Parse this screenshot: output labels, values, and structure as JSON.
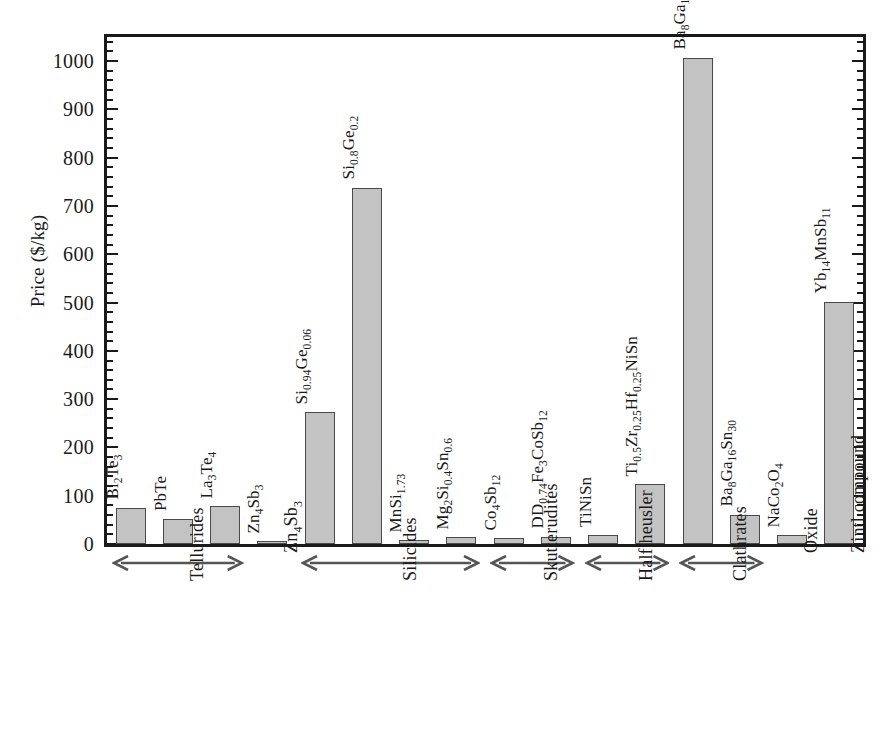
{
  "chart_data": {
    "type": "bar",
    "title": "",
    "xlabel": "",
    "ylabel": "Price ($/kg)",
    "ylim": [
      0,
      1050
    ],
    "grid": false,
    "legend": "none",
    "yticks": [
      0,
      100,
      200,
      300,
      400,
      500,
      600,
      700,
      800,
      900,
      1000
    ],
    "ytick_labels": [
      "0",
      "100",
      "200",
      "300",
      "400",
      "500",
      "600",
      "700",
      "800",
      "900",
      "1000"
    ],
    "minor_ticks_per_interval": 5,
    "categories": [
      "Bi2Te3",
      "PbTe",
      "La3Te4",
      "Zn4Sb3",
      "Si0.94Ge0.06",
      "Si0.8Ge0.2",
      "MnSi1.73",
      "Mg2Si0.4Sn0.6",
      "Co4Sb12",
      "DD0.74Fe3CoSb12",
      "TiNiSn",
      "Ti0.5Zr0.25Hf0.25NiSn",
      "Ba8Ga16Ge30",
      "Ba8Ga16Sn30",
      "NaCo2O4",
      "Yb14MnSb11"
    ],
    "values": [
      75,
      52,
      78,
      6,
      273,
      738,
      8,
      14,
      12,
      15,
      19,
      124,
      1007,
      61,
      18,
      502
    ],
    "bar_color": "#c3c3c3",
    "bar_edge_color": "#4a4a4a",
    "axis_color": "#1a1a1a"
  },
  "axis": {
    "y_title": "Price ($/kg)"
  },
  "bars": [
    {
      "label_html": "Bi<sub>2</sub>Te<sub>3</sub>",
      "value": 75
    },
    {
      "label_html": "PbTe",
      "value": 52
    },
    {
      "label_html": "La<sub>3</sub>Te<sub>4</sub>",
      "value": 78
    },
    {
      "label_html": "Zn<sub>4</sub>Sb<sub>3</sub>",
      "value": 6
    },
    {
      "label_html": "Si<sub>0.94</sub>Ge<sub>0.06</sub>",
      "value": 273
    },
    {
      "label_html": "Si<sub>0.8</sub>Ge<sub>0.2</sub>",
      "value": 738
    },
    {
      "label_html": "MnSi<sub>1.73</sub>",
      "value": 8
    },
    {
      "label_html": "Mg<sub>2</sub>Si<sub>0.4</sub>Sn<sub>0.6</sub>",
      "value": 14
    },
    {
      "label_html": "Co<sub>4</sub>Sb<sub>12</sub>",
      "value": 12
    },
    {
      "label_html": "DD<sub>0.74</sub>Fe<sub>3</sub>CoSb<sub>12</sub>",
      "value": 15
    },
    {
      "label_html": "TiNiSn",
      "value": 19
    },
    {
      "label_html": "Ti<sub>0.5</sub>Zr<sub>0.25</sub>Hf<sub>0.25</sub>NiSn",
      "value": 124
    },
    {
      "label_html": "Ba<sub>8</sub>Ga<sub>16</sub>Ge<sub>30</sub>",
      "value": 1007
    },
    {
      "label_html": "Ba<sub>8</sub>Ga<sub>16</sub>Sn<sub>30</sub>",
      "value": 61
    },
    {
      "label_html": "NaCo<sub>2</sub>O<sub>4</sub>",
      "value": 18
    },
    {
      "label_html": "Yb<sub>14</sub>MnSb<sub>11</sub>",
      "value": 502
    }
  ],
  "groups": [
    {
      "label_html": "Tellurides",
      "arrow": "double",
      "span_start": 0,
      "span_end": 2
    },
    {
      "label_html": "Zn<sub>4</sub>Sb<sub>3</sub>",
      "arrow": "none",
      "span_start": 3,
      "span_end": 3
    },
    {
      "label_html": "Silicides",
      "arrow": "double",
      "span_start": 4,
      "span_end": 7
    },
    {
      "label_html": "Skutterudites",
      "arrow": "double",
      "span_start": 8,
      "span_end": 9
    },
    {
      "label_html": "Half heusler",
      "arrow": "double",
      "span_start": 10,
      "span_end": 11
    },
    {
      "label_html": "Clathrates",
      "arrow": "double",
      "span_start": 12,
      "span_end": 13
    },
    {
      "label_html": "Oxide",
      "arrow": "none",
      "span_start": 14,
      "span_end": 14
    },
    {
      "label_html": "Zintl compound",
      "arrow": "none",
      "span_start": 15,
      "span_end": 15
    }
  ]
}
